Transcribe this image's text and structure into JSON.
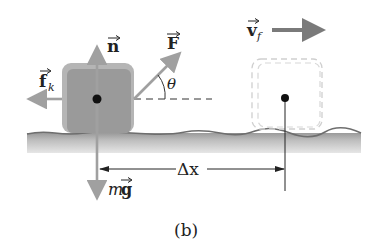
{
  "figure": {
    "caption": "(b)",
    "labels": {
      "normal_force": "n",
      "applied_force": "F",
      "friction": "f",
      "friction_subscript": "k",
      "angle": "θ",
      "final_velocity": "v",
      "velocity_subscript": "f",
      "weight_m": "m",
      "weight_g": "g",
      "displacement": "Δx"
    },
    "colors": {
      "block_fill": "#9e9e9e",
      "block_edge": "#b8b8b8",
      "arrow": "#a0a0a0",
      "velocity_arrow": "#7a7a7a",
      "ground_top": "#8a8a8a",
      "ground_fill": "#c4c4c4",
      "dashed_outline": "#c8c8c8",
      "text": "#222222"
    }
  }
}
